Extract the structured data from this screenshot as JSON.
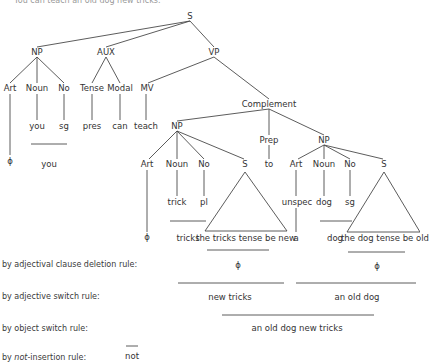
{
  "caption": "You can teach an old dog new tricks.",
  "tree": {
    "S": "S",
    "NP1": "NP",
    "AUX": "AUX",
    "VP": "VP",
    "Art1": "Art",
    "Noun1": "Noun",
    "No1": "No",
    "Tense": "Tense",
    "Modal": "Modal",
    "MV": "MV",
    "you": "you",
    "sg1": "sg",
    "pres": "pres",
    "can": "can",
    "teach": "teach",
    "phi1": "ϕ",
    "you_surface": "you",
    "Complement": "Complement",
    "NP2": "NP",
    "Prep": "Prep",
    "NP3": "NP",
    "Art2": "Art",
    "Noun2": "Noun",
    "No2": "No",
    "S2": "S",
    "to": "to",
    "Art3": "Art",
    "Noun3": "Noun",
    "No3": "No",
    "S3": "S",
    "trick": "trick",
    "pl": "pl",
    "unspec": "unspec",
    "dog": "dog",
    "sg2": "sg",
    "phi2": "ϕ",
    "tricks": "tricks",
    "clause1": "the tricks tense be new",
    "a": "a",
    "dog_surface": "dog",
    "clause2": "the dog tense be old"
  },
  "rules": [
    {
      "label_pre": "by adjectival clause deletion rule:",
      "italic": "",
      "label_post": ""
    },
    {
      "label_pre": "by adjective switch rule:",
      "italic": "",
      "label_post": ""
    },
    {
      "label_pre": "by object switch rule:",
      "italic": "",
      "label_post": ""
    },
    {
      "label_pre": "by ",
      "italic": "not",
      "label_post": "-insertion rule:"
    }
  ],
  "derivations": {
    "phi_a": "ϕ",
    "phi_b": "ϕ",
    "new_tricks": "new tricks",
    "an_old_dog": "an old dog",
    "an_old_dog_new_tricks": "an old dog new tricks",
    "not": "not"
  }
}
